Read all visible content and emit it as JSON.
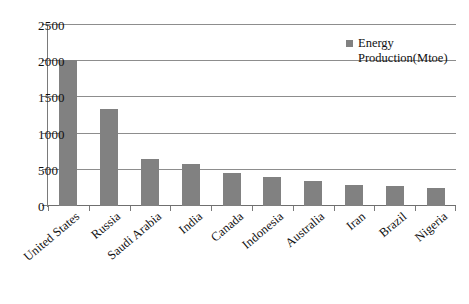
{
  "chart_data": {
    "type": "bar",
    "title": "",
    "xlabel": "",
    "ylabel": "",
    "categories": [
      "United States",
      "Russia",
      "Saudi Arabia",
      "India",
      "Canada",
      "Indonesia",
      "Australia",
      "Iran",
      "Brazil",
      "Nigeria"
    ],
    "series": [
      {
        "name": "Energy Production(Mtoe)",
        "values": [
          2020,
          1340,
          650,
          580,
          460,
          400,
          350,
          290,
          280,
          250
        ],
        "color": "#818181"
      }
    ],
    "values": [
      2020,
      1340,
      650,
      580,
      460,
      400,
      350,
      290,
      280,
      250
    ],
    "ylim": [
      0,
      2500
    ],
    "yticks": [
      0,
      500,
      1000,
      1500,
      2000,
      2500
    ],
    "ytick_labels": [
      "0",
      "500",
      "1000",
      "1500",
      "2000",
      "2500"
    ],
    "grid": "horizontal",
    "legend_position": "top-right",
    "legend_entries": [
      "Energy Production(Mtoe)"
    ]
  },
  "legend": {
    "line1": "Energy",
    "line2": "Production(Mtoe)",
    "swatch_color": "#818181"
  },
  "axis": {
    "y_tick_labels": [
      "2500",
      "2000",
      "1500",
      "1000",
      "500",
      "0"
    ]
  }
}
